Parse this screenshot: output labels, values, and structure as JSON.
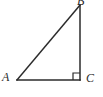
{
  "figure": {
    "kind": "right-triangle-diagram",
    "canvas": {
      "width": 103,
      "height": 97,
      "background": "#ffffff"
    },
    "stroke": {
      "color": "#2b2b2b",
      "width": 1.5
    },
    "vertices": [
      {
        "id": "A",
        "label": "A",
        "x": 17,
        "y": 80,
        "label_x": 2,
        "label_y": 71
      },
      {
        "id": "B",
        "label": "B",
        "x": 80,
        "y": 5,
        "label_x": 77,
        "label_y": -5
      },
      {
        "id": "C",
        "label": "C",
        "x": 80,
        "y": 80,
        "label_x": 86,
        "label_y": 72
      }
    ],
    "edges": [
      {
        "id": "AC",
        "from": "A",
        "to": "C",
        "role": "horizontal-leg"
      },
      {
        "id": "BC",
        "from": "B",
        "to": "C",
        "role": "vertical-leg"
      },
      {
        "id": "AB",
        "from": "A",
        "to": "B",
        "role": "hypotenuse"
      }
    ],
    "right_angle_marker": {
      "at_vertex": "C",
      "size": 7,
      "path": "M 73 80 L 73 73 L 80 73"
    },
    "paths": {
      "horizontal_leg": "M 17 80 L 80 80",
      "vertical_leg": "M 80 80 L 80 5",
      "hypotenuse": "M 17 80 L 80 5"
    }
  }
}
